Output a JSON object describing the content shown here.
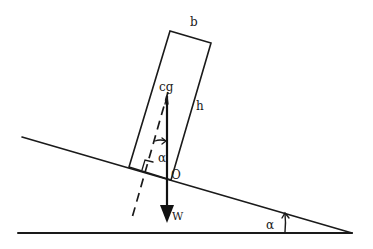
{
  "diagram": {
    "labels": {
      "width": "b",
      "height": "h",
      "center_of_gravity": "cg",
      "pivot": "O",
      "weight": "W",
      "block_angle": "α",
      "incline_angle": "α"
    },
    "colors": {
      "ink": "#1a1a1a",
      "background": "#ffffff"
    },
    "geometry": {
      "ground": {
        "x1": 18,
        "y1": 233,
        "x2": 352,
        "y2": 233
      },
      "incline": {
        "x1": 22,
        "y1": 137,
        "x2": 352,
        "y2": 233
      },
      "block_corners": [
        [
          129,
          167
        ],
        [
          170,
          31
        ],
        [
          211,
          43
        ],
        [
          171,
          180
        ]
      ],
      "cg_point": [
        167,
        96
      ],
      "weight_arrow_end": [
        167,
        222
      ],
      "dashed_normal": {
        "x1": 168,
        "y1": 90,
        "x2": 133,
        "y2": 215
      }
    }
  }
}
